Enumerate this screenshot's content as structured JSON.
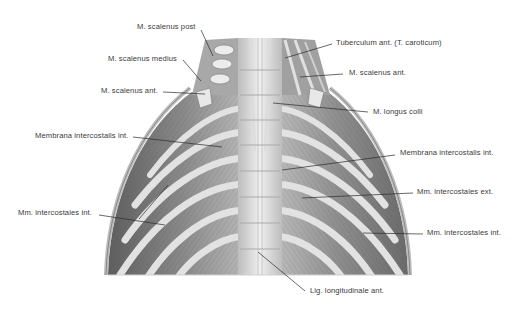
{
  "figure": {
    "colors": {
      "background": "#ffffff",
      "muscle_dark": "#6e6e6e",
      "muscle_mid": "#9a9a9a",
      "rib_light": "#d9d9d9",
      "spine_light": "#e6e6e6",
      "label_text": "#3a3a3a",
      "leader_line": "#2a2a2a"
    }
  },
  "labels": [
    {
      "id": "scalenus-post",
      "text": "M. scalenus post",
      "x": 137,
      "y": 23,
      "line": [
        [
          201,
          30
        ],
        [
          213,
          56
        ]
      ]
    },
    {
      "id": "scalenus-medius",
      "text": "M. scalenus medius",
      "x": 108,
      "y": 55,
      "line": [
        [
          183,
          60
        ],
        [
          201,
          81
        ]
      ]
    },
    {
      "id": "scalenus-ant-left",
      "text": "M. scalenus ant.",
      "x": 101,
      "y": 87,
      "line": [
        [
          163,
          92
        ],
        [
          205,
          94
        ]
      ]
    },
    {
      "id": "membrana-intercostalis-left",
      "text": "Membrana intercostalis int.",
      "x": 35,
      "y": 132,
      "line": [
        [
          133,
          137
        ],
        [
          222,
          147
        ]
      ]
    },
    {
      "id": "tuberculum-ant",
      "text": "Tuberculum ant. (T. caroticum)",
      "x": 336,
      "y": 39,
      "line": [
        [
          332,
          44
        ],
        [
          285,
          58
        ]
      ]
    },
    {
      "id": "scalenus-ant-right",
      "text": "M. scalenus ant.",
      "x": 349,
      "y": 69,
      "line": [
        [
          343,
          74
        ],
        [
          300,
          77
        ]
      ]
    },
    {
      "id": "longus-colli",
      "text": "M. longus colli",
      "x": 373,
      "y": 108,
      "line": [
        [
          368,
          112
        ],
        [
          273,
          103
        ]
      ]
    },
    {
      "id": "membrana-intercostalis-right",
      "text": "Membrana intercostalis int.",
      "x": 400,
      "y": 149,
      "line": [
        [
          395,
          155
        ],
        [
          282,
          170
        ]
      ]
    },
    {
      "id": "intercostales-ext",
      "text": "Mm. intercostales ext.",
      "x": 417,
      "y": 188,
      "line": [
        [
          413,
          193
        ],
        [
          302,
          198
        ]
      ]
    },
    {
      "id": "intercostales-int-left",
      "text": "Mm. intercostales int.",
      "x": 18,
      "y": 209,
      "line": [
        [
          99,
          215
        ],
        [
          165,
          225
        ]
      ],
      "branch": [
        [
          139,
          219
        ],
        [
          168,
          185
        ]
      ]
    },
    {
      "id": "intercostales-int-right",
      "text": "Mm. intercostales int.",
      "x": 427,
      "y": 229,
      "line": [
        [
          423,
          234
        ],
        [
          363,
          233
        ]
      ]
    },
    {
      "id": "lig-longitudinale",
      "text": "Lig. longitudinale ant.",
      "x": 310,
      "y": 287,
      "line": [
        [
          305,
          291
        ],
        [
          258,
          252
        ]
      ]
    }
  ]
}
